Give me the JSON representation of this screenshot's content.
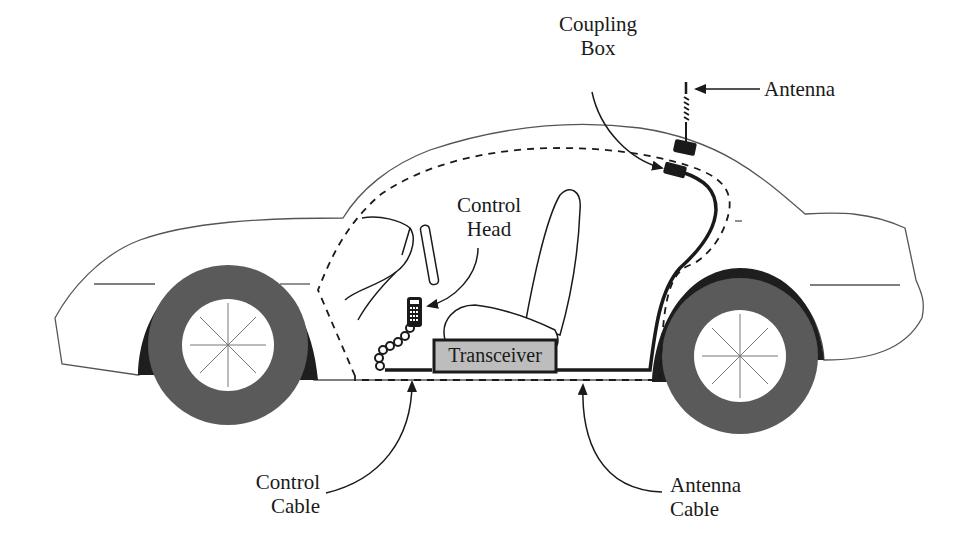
{
  "diagram": {
    "colors": {
      "outline": "#555555",
      "cable": "#1a1a1a",
      "tire": "#5a5a5a",
      "wheel_well": "#1e1e1e",
      "transceiver_fill": "#bdbdbd",
      "background": "#ffffff"
    },
    "labels": {
      "coupling_box": {
        "line1": "Coupling",
        "line2": "Box"
      },
      "antenna": {
        "line1": "Antenna"
      },
      "control_head": {
        "line1": "Control",
        "line2": "Head"
      },
      "transceiver": {
        "line1": "Transceiver"
      },
      "control_cable": {
        "line1": "Control",
        "line2": "Cable"
      },
      "antenna_cable": {
        "line1": "Antenna",
        "line2": "Cable"
      }
    },
    "components": [
      "car-body",
      "front-wheel",
      "rear-wheel",
      "steering-wheel",
      "seat",
      "control-head",
      "coiled-cord",
      "transceiver",
      "control-cable",
      "antenna-cable",
      "coupling-box",
      "antenna",
      "dashed-cable-route"
    ]
  }
}
